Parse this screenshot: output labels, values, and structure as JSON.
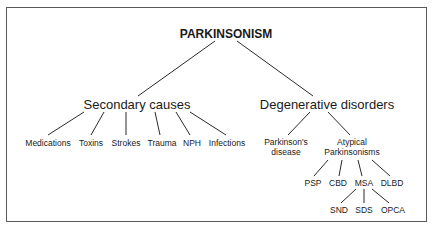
{
  "diagram": {
    "title": "PARKINSONISM",
    "branches": [
      {
        "label": "Secondary causes",
        "children": [
          "Medications",
          "Toxins",
          "Strokes",
          "Trauma",
          "NPH",
          "Infections"
        ]
      },
      {
        "label": "Degenerative disorders",
        "children": [
          {
            "label_line1": "Parkinson's",
            "label_line2": "disease"
          },
          {
            "label_line1": "Atypical",
            "label_line2": "Parkinsonisms",
            "children": [
              {
                "label": "PSP"
              },
              {
                "label": "CBD"
              },
              {
                "label": "MSA",
                "children": [
                  "SND",
                  "SDS",
                  "OPCA"
                ]
              },
              {
                "label": "DLBD"
              }
            ]
          }
        ]
      }
    ]
  }
}
